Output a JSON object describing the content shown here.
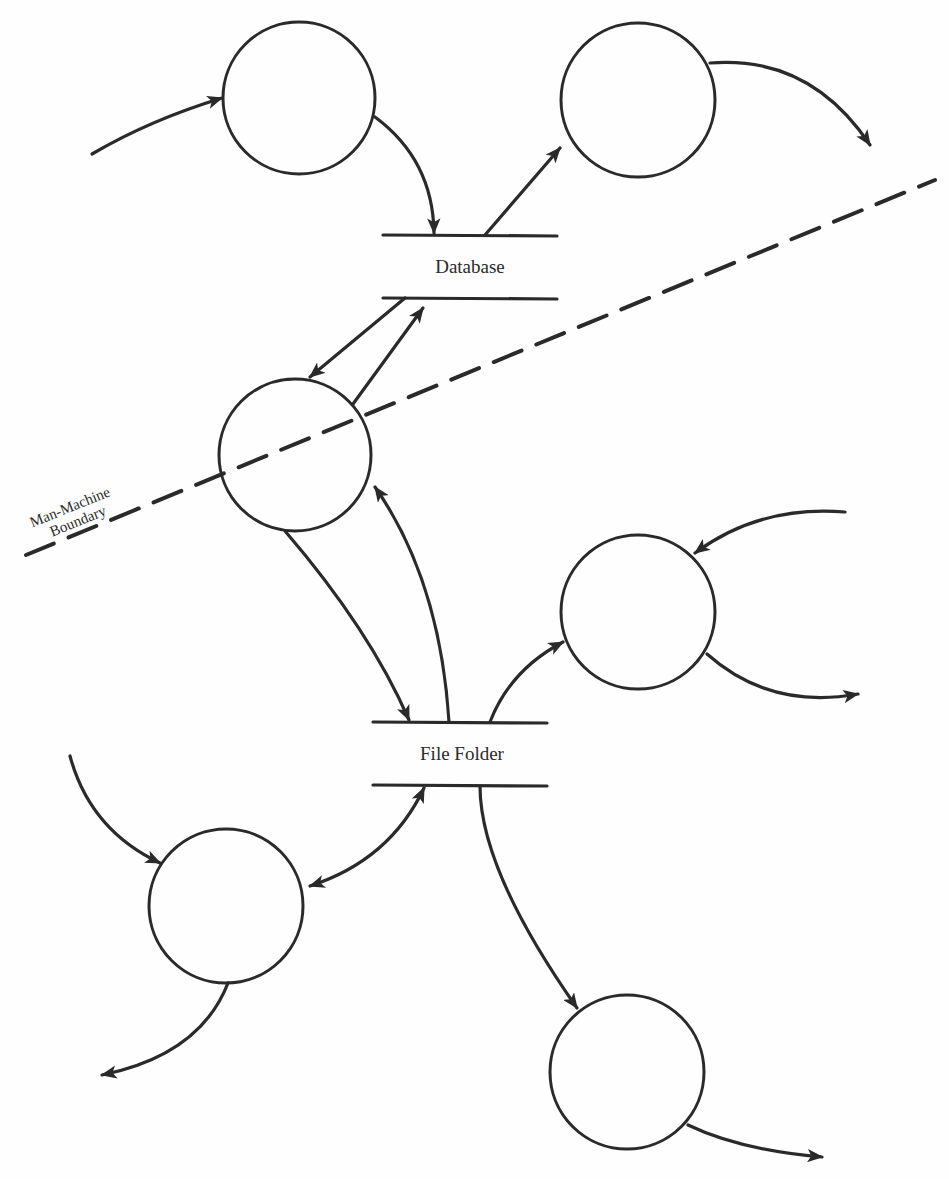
{
  "diagram": {
    "type": "data-flow-diagram",
    "colors": {
      "ink": "#2a2a2a",
      "background": "#fefefe"
    },
    "stores": [
      {
        "id": "database",
        "label": "Database"
      },
      {
        "id": "file-folder",
        "label": "File Folder"
      }
    ],
    "boundary": {
      "label_line1": "Man-Machine",
      "label_line2": "Boundary"
    },
    "processes": [
      {
        "id": "p1",
        "position": "top-left"
      },
      {
        "id": "p2",
        "position": "top-right"
      },
      {
        "id": "p3",
        "position": "middle-left (on boundary)"
      },
      {
        "id": "p4",
        "position": "middle-right"
      },
      {
        "id": "p5",
        "position": "bottom-left"
      },
      {
        "id": "p6",
        "position": "bottom-right"
      }
    ],
    "flows": [
      {
        "from": "external",
        "to": "p1"
      },
      {
        "from": "p1",
        "to": "database"
      },
      {
        "from": "database",
        "to": "p2"
      },
      {
        "from": "p2",
        "to": "external"
      },
      {
        "from": "database",
        "to": "p3"
      },
      {
        "from": "p3",
        "to": "database"
      },
      {
        "from": "p3",
        "to": "file-folder"
      },
      {
        "from": "file-folder",
        "to": "p3"
      },
      {
        "from": "external",
        "to": "p4"
      },
      {
        "from": "file-folder",
        "to": "p4"
      },
      {
        "from": "p4",
        "to": "external"
      },
      {
        "from": "external",
        "to": "p5"
      },
      {
        "from": "p5",
        "to": "file-folder",
        "bidirectional": true
      },
      {
        "from": "p5",
        "to": "external"
      },
      {
        "from": "file-folder",
        "to": "p6"
      },
      {
        "from": "p6",
        "to": "external"
      }
    ]
  }
}
